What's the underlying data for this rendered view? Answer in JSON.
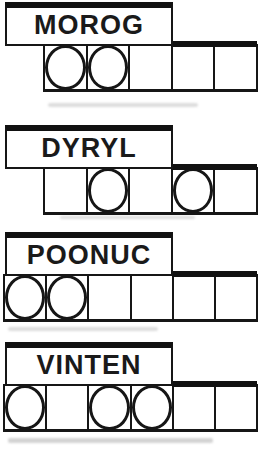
{
  "page": {
    "background_color": "#ffffff",
    "ink_color": "#161616"
  },
  "groups": [
    {
      "word": "MOROG",
      "cell_count": 5,
      "marked": [
        1,
        1,
        0,
        0,
        0
      ]
    },
    {
      "word": "DYRYL",
      "cell_count": 5,
      "marked": [
        0,
        1,
        0,
        1,
        0
      ]
    },
    {
      "word": "POONUC",
      "cell_count": 6,
      "marked": [
        1,
        1,
        0,
        0,
        0,
        0
      ]
    },
    {
      "word": "VINTEN",
      "cell_count": 6,
      "marked": [
        1,
        0,
        1,
        1,
        0,
        0
      ]
    }
  ]
}
